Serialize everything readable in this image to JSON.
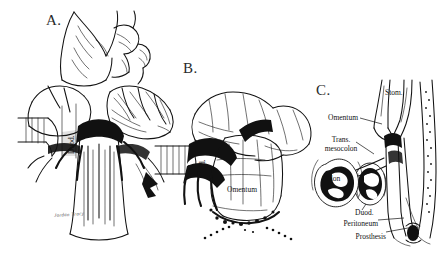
{
  "figure": {
    "background_color": "#ffffff",
    "ink_color": "#121212",
    "style": "pen-and-ink line drawing"
  },
  "panels": [
    {
      "id": "A",
      "letter": "A.",
      "caption": "Operative view: omentum mobilized over retroperitoneum",
      "labels": [
        {
          "name": "duodenum",
          "text": "Duod.",
          "orientation": "vertical"
        }
      ],
      "signature": "Jordan Tracy"
    },
    {
      "id": "B",
      "letter": "B.",
      "caption": "Operative view: omentum drawn down and sutured over prosthesis",
      "labels": [
        {
          "name": "duodenum",
          "text": "Duod.",
          "orientation": "vertical"
        },
        {
          "name": "omentum",
          "text": "Omentum",
          "orientation": "horizontal"
        }
      ]
    },
    {
      "id": "C",
      "letter": "C.",
      "caption": "Sagittal cross-section showing layers over the prosthesis",
      "labels": [
        {
          "name": "stomach",
          "text": "Stom.",
          "orientation": "horizontal",
          "leader": false
        },
        {
          "name": "omentum",
          "text": "Omentum",
          "orientation": "horizontal",
          "leader": true
        },
        {
          "name": "transverse-mesocolon",
          "text": "Trans.\nmesocolon",
          "line1": "Trans.",
          "line2": "mesocolon",
          "orientation": "horizontal",
          "leader": true
        },
        {
          "name": "colon",
          "text": "Colon",
          "orientation": "horizontal",
          "leader": false
        },
        {
          "name": "duodenum",
          "text": "Duod.",
          "orientation": "horizontal",
          "leader": true
        },
        {
          "name": "peritoneum",
          "text": "Peritoneum",
          "orientation": "horizontal",
          "leader": true
        },
        {
          "name": "prosthesis",
          "text": "Prosthesis",
          "orientation": "horizontal",
          "leader": true
        }
      ]
    }
  ]
}
